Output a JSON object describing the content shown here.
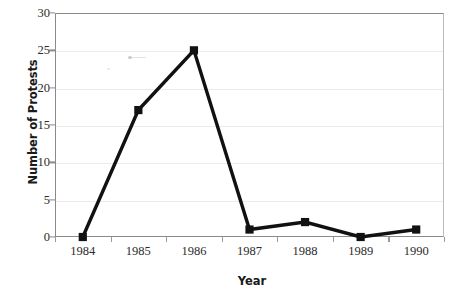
{
  "chart_data": {
    "type": "line",
    "title": "",
    "xlabel": "Year",
    "ylabel": "Number of Protests",
    "categories": [
      "1984",
      "1985",
      "1986",
      "1987",
      "1988",
      "1989",
      "1990"
    ],
    "values": [
      0,
      17,
      25,
      1,
      2,
      0,
      1
    ],
    "series": [
      {
        "name": "Number of Protests",
        "values": [
          0,
          17,
          25,
          1,
          2,
          0,
          1
        ]
      }
    ],
    "ylim": [
      0,
      30
    ],
    "yticks": [
      0,
      5,
      10,
      15,
      20,
      25,
      30
    ],
    "ytick_labels": [
      "0",
      "5",
      "10",
      "15",
      "20",
      "25",
      "30"
    ],
    "xtick_labels": [
      "1984",
      "1985",
      "1986",
      "1987",
      "1988",
      "1989",
      "1990"
    ],
    "grid": "horizontal",
    "legend": "none",
    "marker": "square",
    "line_color": "#111111",
    "marker_color": "#111111",
    "grid_color": "#eceaea",
    "axis_color": "#8a8a8a",
    "background_color": "#ffffff"
  },
  "axes": {
    "y_title": "Number of Protests",
    "x_title": "Year"
  }
}
